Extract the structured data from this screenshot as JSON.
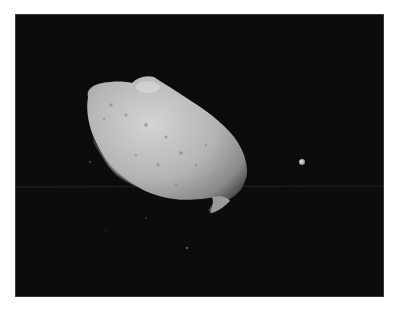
{
  "image": {
    "description": "Space photograph of an elongated, cratered grey asteroid against a black sky with a small bright moon to its right and faint star specks",
    "background_color": "#0d0d0d",
    "page_color": "#ffffff",
    "subjects": [
      {
        "name": "asteroid",
        "color": "#b8b8b8",
        "shape": "elongated potato-shaped body, tilted diagonally from upper-left to lower-right"
      },
      {
        "name": "moon",
        "color": "#d0d0d0",
        "shape": "small round dot"
      }
    ],
    "artifacts": [
      "faint horizontal scan line across frame"
    ]
  }
}
